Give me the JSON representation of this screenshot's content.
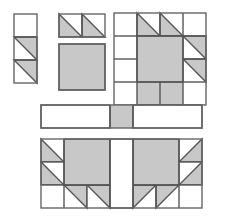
{
  "page": {
    "width": 226,
    "height": 218,
    "background_color": "#ffffff"
  },
  "palette": {
    "fabric_light": "#ffffff",
    "fabric_shaded": "#c8c8c8",
    "seam_line": "#555555",
    "outline": "#666666"
  },
  "style": {
    "unit": 23,
    "stroke_width": 1.4
  },
  "chart_data": {
    "type": "diagram",
    "notation": {
      "plain": "solid light (white) patch",
      "shaded": "solid shaded (gray) patch",
      "hst_tl": "half-square triangle, shaded half in TOP-LEFT",
      "hst_tr": "half-square triangle, shaded half in TOP-RIGHT",
      "hst_bl": "half-square triangle, shaded half in BOTTOM-LEFT",
      "hst_br": "half-square triangle, shaded half in BOTTOM-RIGHT",
      "empty": "no patch drawn"
    },
    "units": [
      {
        "name": "strip-unit",
        "label": "vertical 1x3 strip",
        "x": 14,
        "y": 14,
        "cols": 1,
        "rows": 3,
        "cells": [
          [
            "plain"
          ],
          [
            "hst_tr"
          ],
          [
            "hst_tr"
          ]
        ]
      },
      {
        "name": "hst-pair-unit",
        "label": "pair of half-square triangles",
        "x": 59,
        "y": 14,
        "cols": 2,
        "rows": 1,
        "cells": [
          [
            "hst_bl",
            "hst_bl"
          ]
        ]
      },
      {
        "name": "center-square-unit",
        "label": "large shaded center square",
        "x": 59,
        "y": 44,
        "cols": 2,
        "rows": 2,
        "merged_fill": "shaded",
        "cells": [
          [
            "shaded",
            "shaded"
          ],
          [
            "shaded",
            "shaded"
          ]
        ]
      },
      {
        "name": "paw-block-unit",
        "label": "assembled bear-paw block",
        "x": 114,
        "y": 13,
        "cols": 4,
        "rows": 4,
        "merged_center": {
          "col": 1,
          "row": 1,
          "cols": 2,
          "rows": 2,
          "fill": "shaded"
        },
        "cells": [
          [
            "plain",
            "hst_bl",
            "hst_bl",
            "plain"
          ],
          [
            "plain",
            "shaded",
            "shaded",
            "hst_tr"
          ],
          [
            "plain",
            "shaded",
            "shaded",
            "hst_tr"
          ],
          [
            "plain",
            "shaded",
            "shaded",
            "plain"
          ]
        ]
      },
      {
        "name": "sashing-unit",
        "label": "sashing strip with cornerstone",
        "x": 41,
        "y": 105,
        "cols": 7,
        "rows": 1,
        "cells": [
          [
            "plain",
            "plain",
            "plain",
            "shaded",
            "plain",
            "plain",
            "plain"
          ]
        ],
        "merged_runs": [
          {
            "col": 0,
            "cols": 3,
            "fill": "plain"
          },
          {
            "col": 4,
            "cols": 3,
            "fill": "plain"
          }
        ]
      },
      {
        "name": "mirrored-pair-unit",
        "label": "two mirrored paw blocks joined by a light column",
        "x": 41,
        "y": 139,
        "cols": 7,
        "rows": 3,
        "merged_blocks": [
          {
            "col": 1,
            "row": 0,
            "cols": 2,
            "rows": 2,
            "fill": "shaded"
          },
          {
            "col": 4,
            "row": 0,
            "cols": 2,
            "rows": 2,
            "fill": "shaded"
          },
          {
            "col": 3,
            "row": 0,
            "cols": 1,
            "rows": 3,
            "fill": "plain"
          }
        ],
        "cells": [
          [
            "hst_bl",
            "shaded",
            "shaded",
            "plain",
            "shaded",
            "shaded",
            "hst_br"
          ],
          [
            "hst_bl",
            "shaded",
            "shaded",
            "plain",
            "shaded",
            "shaded",
            "hst_br"
          ],
          [
            "plain",
            "hst_tr",
            "hst_tr",
            "plain",
            "hst_tl",
            "hst_tl",
            "plain"
          ]
        ]
      }
    ]
  }
}
